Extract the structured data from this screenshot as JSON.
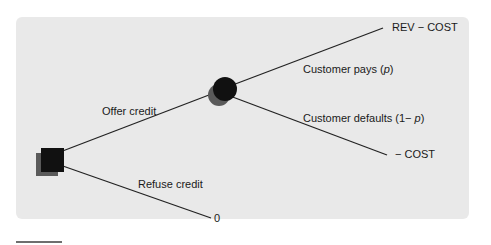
{
  "diagram": {
    "type": "decision-tree",
    "background_color": "#e9e9e9",
    "nodes": {
      "decision": {
        "shape": "square",
        "color": "#111111",
        "shadow_color": "#5a5a5a"
      },
      "chance": {
        "shape": "circle",
        "color": "#111111",
        "shadow_color": "#5a5a5a"
      }
    },
    "branches": {
      "offer": {
        "label": "Offer credit"
      },
      "refuse": {
        "label": "Refuse credit",
        "payoff": "0"
      },
      "pays": {
        "label_prefix": "Customer pays (",
        "label_var": "p",
        "label_suffix": ")",
        "payoff": "REV − COST"
      },
      "defaults": {
        "label_prefix": "Customer defaults (1− ",
        "label_var": "p",
        "label_suffix": ")",
        "payoff": "− COST"
      }
    }
  }
}
